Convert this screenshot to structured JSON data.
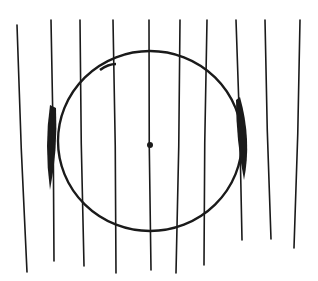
{
  "figure": {
    "ink_color": "#1a1a1a",
    "background": "#ffffff",
    "circle": {
      "cx": 150,
      "cy": 141,
      "rx": 92,
      "ry": 90
    },
    "center_dot": {
      "x": 150,
      "y": 145,
      "r": 3
    },
    "vertical_lines": [
      {
        "x1": 17,
        "y1": 25,
        "x2": 27,
        "y2": 272
      },
      {
        "x1": 51,
        "y1": 20,
        "x2": 54,
        "y2": 261
      },
      {
        "x1": 80,
        "y1": 20,
        "x2": 84,
        "y2": 266
      },
      {
        "x1": 113,
        "y1": 20,
        "x2": 116,
        "y2": 273
      },
      {
        "x1": 149,
        "y1": 20,
        "x2": 151,
        "y2": 270
      },
      {
        "x1": 180,
        "y1": 20,
        "x2": 176,
        "y2": 273
      },
      {
        "x1": 207,
        "y1": 20,
        "x2": 204,
        "y2": 265
      },
      {
        "x1": 236,
        "y1": 20,
        "x2": 242,
        "y2": 240
      },
      {
        "x1": 265,
        "y1": 20,
        "x2": 271,
        "y2": 239
      },
      {
        "x1": 300,
        "y1": 20,
        "x2": 294,
        "y2": 248
      }
    ],
    "crescents": [
      {
        "side": "left",
        "path": "M50 105 Q44 145 50 190 Q58 150 56 108 Z"
      },
      {
        "side": "right",
        "path": "M240 97 Q252 140 244 180 Q236 140 236 100 Z"
      }
    ]
  }
}
